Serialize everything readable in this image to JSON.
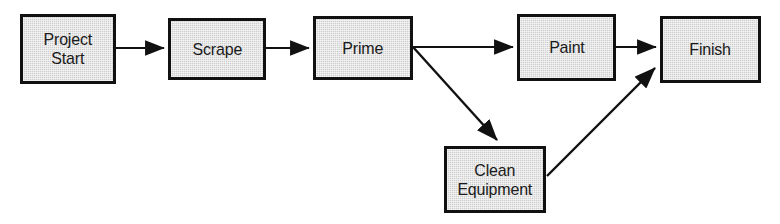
{
  "diagram": {
    "type": "flowchart",
    "canvas": {
      "width": 780,
      "height": 224,
      "background": "#ffffff"
    },
    "style": {
      "node_fill": "#cfcfcf",
      "node_border": "#111111",
      "edge_color": "#111111",
      "text_color": "#1a1a1a"
    },
    "nodes": [
      {
        "id": "project-start",
        "label": "Project\nStart",
        "x": 20,
        "y": 14,
        "width": 96,
        "height": 70
      },
      {
        "id": "scrape",
        "label": "Scrape",
        "x": 168,
        "y": 18,
        "width": 98,
        "height": 62
      },
      {
        "id": "prime",
        "label": "Prime",
        "x": 313,
        "y": 16,
        "width": 100,
        "height": 64
      },
      {
        "id": "paint",
        "label": "Paint",
        "x": 517,
        "y": 14,
        "width": 99,
        "height": 67
      },
      {
        "id": "finish",
        "label": "Finish",
        "x": 660,
        "y": 16,
        "width": 101,
        "height": 67
      },
      {
        "id": "clean-equipment",
        "label": "Clean\nEquipment",
        "x": 444,
        "y": 146,
        "width": 102,
        "height": 67
      }
    ],
    "edges": [
      {
        "id": "start-to-scrape",
        "from": "project-start",
        "to": "scrape",
        "kind": "arrow",
        "x1": 116,
        "y1": 48,
        "x2": 166,
        "y2": 48
      },
      {
        "id": "scrape-to-prime",
        "from": "scrape",
        "to": "prime",
        "kind": "arrow",
        "x1": 266,
        "y1": 48,
        "x2": 311,
        "y2": 48
      },
      {
        "id": "prime-to-paint",
        "from": "prime",
        "to": "paint",
        "kind": "arrow",
        "x1": 413,
        "y1": 47,
        "x2": 515,
        "y2": 47
      },
      {
        "id": "prime-to-clean-equipment",
        "from": "prime",
        "to": "clean-equipment",
        "kind": "arrow",
        "x1": 413,
        "y1": 47,
        "x2": 500,
        "y2": 143
      },
      {
        "id": "paint-to-finish",
        "from": "paint",
        "to": "finish",
        "kind": "arrow",
        "x1": 616,
        "y1": 47,
        "x2": 658,
        "y2": 47
      },
      {
        "id": "clean-equipment-to-finish",
        "from": "clean-equipment",
        "to": "finish",
        "kind": "arrow",
        "x1": 547,
        "y1": 176,
        "x2": 658,
        "y2": 65
      }
    ]
  }
}
